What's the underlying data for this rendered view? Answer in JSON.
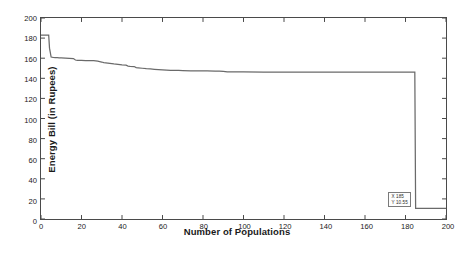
{
  "chart_data": {
    "type": "line",
    "title": "",
    "xlabel": "Number of Populations",
    "ylabel": "Energy Bill (in Rupees)",
    "xlim": [
      0,
      200
    ],
    "ylim": [
      0,
      200
    ],
    "xticks": [
      0,
      20,
      40,
      60,
      80,
      100,
      120,
      140,
      160,
      180,
      200
    ],
    "yticks": [
      0,
      20,
      40,
      60,
      80,
      100,
      120,
      140,
      160,
      180,
      200
    ],
    "grid": false,
    "legend": null,
    "line_color": "#6a6a6a",
    "series": [
      {
        "name": "Energy Bill",
        "x": [
          0,
          1,
          2,
          3,
          3.8,
          4.2,
          5,
          6,
          7,
          8,
          9,
          10,
          12,
          14,
          16,
          17,
          18,
          20,
          22,
          24,
          26,
          28,
          30,
          31,
          32,
          34,
          36,
          38,
          40,
          42,
          43,
          44,
          46,
          47,
          48,
          50,
          52,
          54,
          56,
          58,
          60,
          62,
          64,
          66,
          68,
          70,
          74,
          78,
          82,
          86,
          88,
          90,
          92,
          96,
          100,
          110,
          120,
          130,
          140,
          150,
          160,
          170,
          180,
          184.6,
          185,
          186,
          190,
          195,
          200
        ],
        "y": [
          183.0,
          183.0,
          183.0,
          183.0,
          183.0,
          170.0,
          161.2,
          160.8,
          160.6,
          160.5,
          160.4,
          160.3,
          160.1,
          159.9,
          159.6,
          158.2,
          157.9,
          157.8,
          157.7,
          157.6,
          157.5,
          157.0,
          156.2,
          155.6,
          155.3,
          154.8,
          154.3,
          153.9,
          153.4,
          153.0,
          152.2,
          151.9,
          151.7,
          150.6,
          150.4,
          150.0,
          149.6,
          149.3,
          149.0,
          148.7,
          148.4,
          148.2,
          148.0,
          147.9,
          147.8,
          147.7,
          147.5,
          147.4,
          147.3,
          147.2,
          147.1,
          146.9,
          146.4,
          146.3,
          146.3,
          146.2,
          146.2,
          146.2,
          146.2,
          146.2,
          146.2,
          146.2,
          146.2,
          146.2,
          10.55,
          10.55,
          10.55,
          10.55,
          10.55
        ]
      }
    ],
    "annotations": [
      {
        "name": "datatip",
        "x": 185,
        "y": 10.55,
        "x_label": "X 185",
        "y_label": "Y 10.55"
      }
    ]
  }
}
